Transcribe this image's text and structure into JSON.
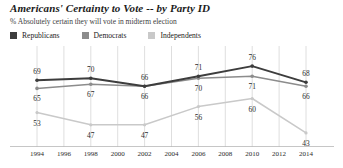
{
  "chart_data": {
    "type": "line",
    "title": "Americans' Certainty to Vote -- by Party ID",
    "subtitle": "% Absolutely certain they will vote in midterm election",
    "xlabel": "",
    "ylabel": "",
    "ylim": [
      38,
      80
    ],
    "grid": "vertical",
    "legend_position": "top-left",
    "x": [
      1994,
      1998,
      2002,
      2006,
      2010,
      2014
    ],
    "tick_labels": [
      "1994",
      "1996",
      "1998",
      "2000",
      "2002",
      "2004",
      "2006",
      "2008",
      "2010",
      "2012",
      "2014"
    ],
    "tick_values": [
      1994,
      1996,
      1998,
      2000,
      2002,
      2004,
      2006,
      2008,
      2010,
      2012,
      2014
    ],
    "series": [
      {
        "name": "Republicans",
        "color": "#3d3d3d",
        "values": [
          69,
          70,
          66,
          71,
          76,
          68
        ],
        "label_position": "above"
      },
      {
        "name": "Democrats",
        "color": "#8c8c8c",
        "values": [
          65,
          67,
          66,
          70,
          71,
          66
        ],
        "label_position": "below"
      },
      {
        "name": "Independents",
        "color": "#c9c9c9",
        "values": [
          53,
          47,
          47,
          56,
          60,
          43
        ],
        "label_position": "below"
      }
    ]
  },
  "legend": {
    "items": [
      {
        "label": "Republicans",
        "color": "#3d3d3d"
      },
      {
        "label": "Democrats",
        "color": "#8c8c8c"
      },
      {
        "label": "Independents",
        "color": "#c9c9c9"
      }
    ]
  },
  "colors": {
    "gridline": "#d5d5d5",
    "axis": "#b8b8b8",
    "text": "#2a2a2a",
    "title": "#1b1b1b"
  }
}
